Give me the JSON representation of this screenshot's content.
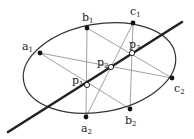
{
  "diagram": {
    "ellipse": {
      "cx": 99.5,
      "cy": 68,
      "rx": 77,
      "ry": 44,
      "rotate": -10
    },
    "thick_line": {
      "x1": 8,
      "y1": 132,
      "x2": 182,
      "y2": 22
    },
    "points": {
      "a1": {
        "x": 40,
        "y": 53,
        "label": "a",
        "sub": "1",
        "lx": 22,
        "ly": 50
      },
      "b1": {
        "x": 87,
        "y": 28,
        "label": "b",
        "sub": "1",
        "lx": 82,
        "ly": 21
      },
      "c1": {
        "x": 133,
        "y": 23,
        "label": "c",
        "sub": "1",
        "lx": 130,
        "ly": 15
      },
      "a2": {
        "x": 86,
        "y": 117,
        "label": "a",
        "sub": "2",
        "lx": 81,
        "ly": 132
      },
      "b2": {
        "x": 130,
        "y": 109,
        "label": "b",
        "sub": "2",
        "lx": 125,
        "ly": 124
      },
      "c2": {
        "x": 172,
        "y": 78,
        "label": "c",
        "sub": "2",
        "lx": 174,
        "ly": 92
      },
      "p1": {
        "x": 87,
        "y": 85,
        "label": "p",
        "sub": "1",
        "lx": 72,
        "ly": 84
      },
      "p2": {
        "x": 111,
        "y": 67,
        "label": "p",
        "sub": "2",
        "lx": 97,
        "ly": 66
      },
      "p3": {
        "x": 132,
        "y": 53,
        "label": "p",
        "sub": "3",
        "lx": 129,
        "ly": 48
      }
    },
    "thin_lines": [
      [
        "a1",
        "b2"
      ],
      [
        "a2",
        "b1"
      ],
      [
        "a1",
        "c2"
      ],
      [
        "a2",
        "c1"
      ],
      [
        "b1",
        "c2"
      ],
      [
        "b2",
        "c1"
      ]
    ],
    "colors": {
      "stroke": "#333333",
      "thin": "#888888",
      "point": "#111111"
    }
  }
}
